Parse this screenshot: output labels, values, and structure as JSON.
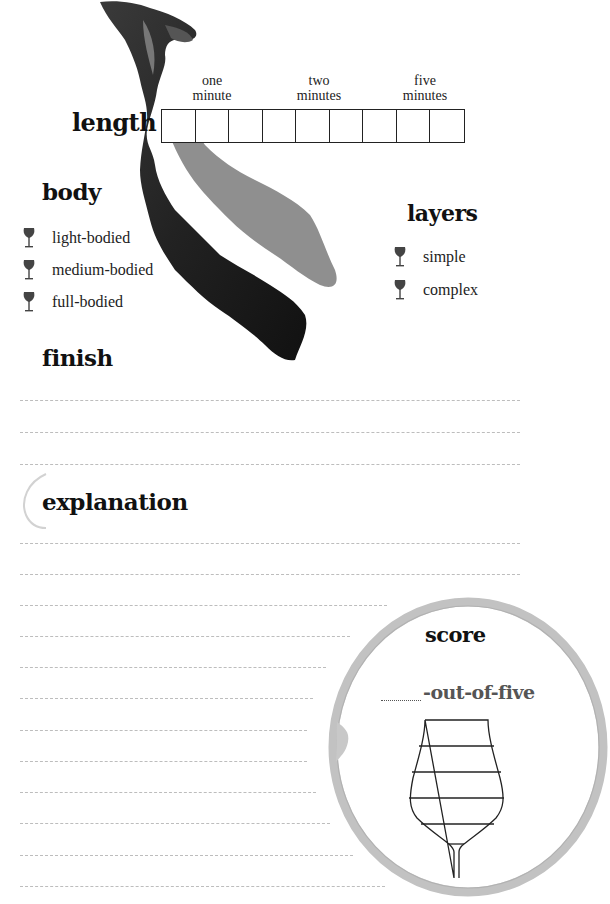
{
  "length": {
    "title": "length",
    "markers": [
      {
        "label_line1": "one",
        "label_line2": "minute"
      },
      {
        "label_line1": "two",
        "label_line2": "minutes"
      },
      {
        "label_line1": "five",
        "label_line2": "minutes"
      }
    ],
    "box_count": 9
  },
  "body": {
    "title": "body",
    "options": [
      {
        "label": "light-bodied",
        "icon": "wine-glass-icon"
      },
      {
        "label": "medium-bodied",
        "icon": "wine-glass-icon"
      },
      {
        "label": "full-bodied",
        "icon": "wine-glass-icon"
      }
    ]
  },
  "layers": {
    "title": "layers",
    "options": [
      {
        "label": "simple",
        "icon": "wine-glass-icon"
      },
      {
        "label": "complex",
        "icon": "wine-glass-icon"
      }
    ]
  },
  "finish": {
    "title": "finish",
    "line_count": 3
  },
  "explanation": {
    "title": "explanation",
    "line_count": 12
  },
  "score": {
    "title": "score",
    "suffix": "-out-of-five",
    "glass_levels": 5
  },
  "colors": {
    "heading": "#111111",
    "text": "#222222",
    "rule_line": "#bdbdbd",
    "stain_ring": "#b8b8b8",
    "icon": "#444444"
  }
}
